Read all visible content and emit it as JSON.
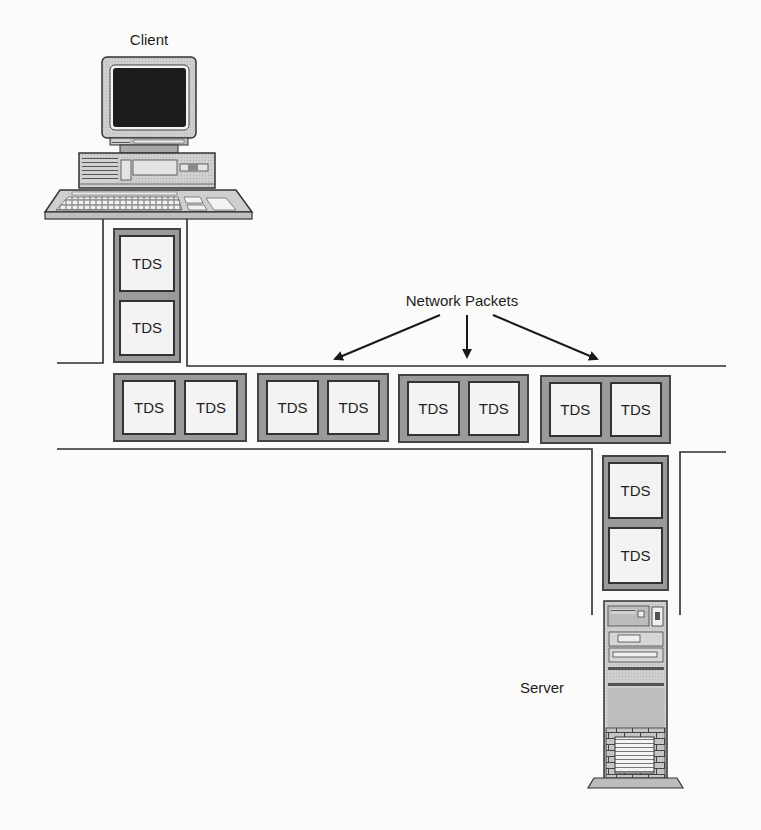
{
  "diagram": {
    "client": {
      "label": "Client",
      "icon": "desktop-computer-icon"
    },
    "server": {
      "label": "Server",
      "icon": "tower-server-icon"
    },
    "network_packets_label": "Network Packets",
    "client_channel": {
      "packet": [
        "TDS",
        "TDS"
      ]
    },
    "network_channel": {
      "packets": [
        [
          "TDS",
          "TDS"
        ],
        [
          "TDS",
          "TDS"
        ],
        [
          "TDS",
          "TDS"
        ],
        [
          "TDS",
          "TDS"
        ]
      ]
    },
    "server_channel": {
      "packet": [
        "TDS",
        "TDS"
      ]
    },
    "arrow_count": 3
  },
  "colors": {
    "background": "#fbfbf9",
    "line": "#2e2e2e",
    "packet_frame": "#9a9a9a",
    "packet_cell": "#f3f3f3",
    "monitor_screen": "#1c1c1c"
  }
}
